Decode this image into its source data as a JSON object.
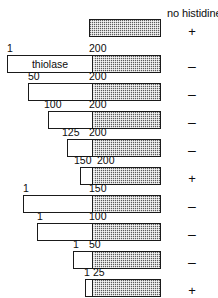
{
  "figure": {
    "column_header": "no histidine",
    "gene_label": "thiolase",
    "shading_boundary_residue": 200,
    "rows": [
      {
        "id": "row-1",
        "start_label": "",
        "end_label": "",
        "open_start": null,
        "open_end": null,
        "fill_start": 200,
        "fill_end": 400,
        "growth": "+"
      },
      {
        "id": "row-2",
        "start_label": "1",
        "end_label": "200",
        "open_start": 1,
        "open_end": 200,
        "fill_start": 200,
        "fill_end": 400,
        "growth": "–"
      },
      {
        "id": "row-3",
        "start_label": "50",
        "end_label": "200",
        "open_start": 50,
        "open_end": 200,
        "fill_start": 200,
        "fill_end": 400,
        "growth": "–"
      },
      {
        "id": "row-4",
        "start_label": "100",
        "end_label": "200",
        "open_start": 100,
        "open_end": 200,
        "fill_start": 200,
        "fill_end": 400,
        "growth": "–"
      },
      {
        "id": "row-5",
        "start_label": "125",
        "end_label": "200",
        "open_start": 125,
        "open_end": 200,
        "fill_start": 200,
        "fill_end": 400,
        "growth": "–"
      },
      {
        "id": "row-6",
        "start_label": "150",
        "end_label": "200",
        "open_start": 150,
        "open_end": 200,
        "fill_start": 200,
        "fill_end": 400,
        "growth": "+"
      },
      {
        "id": "row-7",
        "start_label": "1",
        "end_label": "150",
        "open_start": 1,
        "open_end": 150,
        "fill_start": 200,
        "fill_end": 400,
        "growth": "–"
      },
      {
        "id": "row-8",
        "start_label": "1",
        "end_label": "100",
        "open_start": 1,
        "open_end": 100,
        "fill_start": 200,
        "fill_end": 400,
        "growth": "–"
      },
      {
        "id": "row-9",
        "start_label": "1",
        "end_label": "50",
        "open_start": 1,
        "open_end": 50,
        "fill_start": 200,
        "fill_end": 400,
        "growth": "–"
      },
      {
        "id": "row-10",
        "start_label": "1",
        "end_label": "25",
        "open_start": 1,
        "open_end": 25,
        "fill_start": 200,
        "fill_end": 400,
        "growth": "+"
      }
    ]
  }
}
